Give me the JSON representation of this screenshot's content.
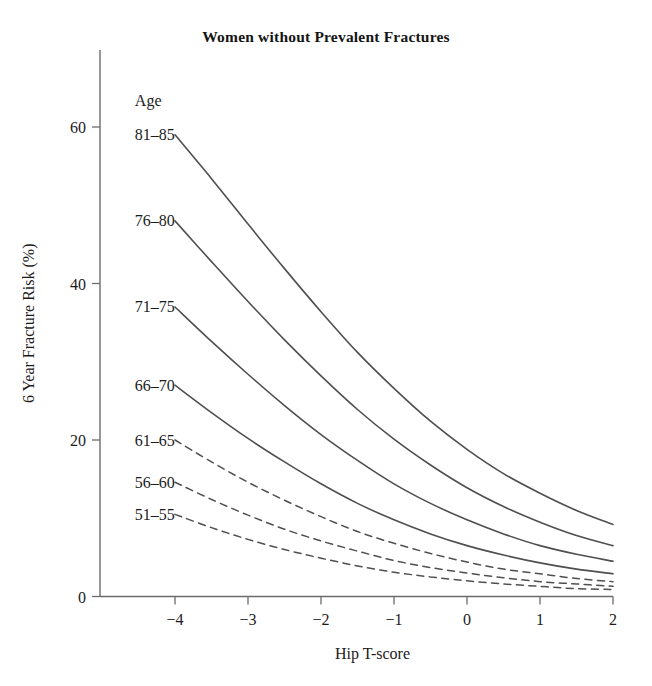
{
  "chart_data": {
    "type": "line",
    "title": "Women without Prevalent Fractures",
    "xlabel": "Hip T-score",
    "ylabel": "6 Year Fracture Risk (%)",
    "xlim": [
      -4.7,
      2.0
    ],
    "ylim": [
      0,
      64
    ],
    "xticks": [
      -4,
      -3,
      -2,
      -1,
      0,
      1,
      2
    ],
    "xticklabels": [
      "−4",
      "−3",
      "−2",
      "−1",
      "0",
      "1",
      "2"
    ],
    "yticks": [
      0,
      20,
      40,
      60
    ],
    "yticklabels": [
      "0",
      "20",
      "40",
      "60"
    ],
    "grid": false,
    "legend_position": "inline-left-of-curves",
    "legend_title": "Age",
    "x": [
      -4,
      -3.5,
      -3,
      -2.5,
      -2,
      -1.5,
      -1,
      -0.5,
      0,
      0.5,
      1,
      1.5,
      2
    ],
    "series": [
      {
        "name": "81–85",
        "style": "solid",
        "color": "#4f4f4f",
        "values": [
          59.0,
          53.4,
          47.6,
          41.9,
          36.4,
          31.2,
          26.6,
          22.4,
          18.8,
          15.7,
          13.2,
          11.0,
          9.2
        ]
      },
      {
        "name": "76–80",
        "style": "solid",
        "color": "#4f4f4f",
        "values": [
          48.0,
          42.8,
          37.7,
          32.8,
          28.2,
          23.9,
          20.1,
          16.8,
          13.9,
          11.5,
          9.5,
          7.8,
          6.5
        ]
      },
      {
        "name": "71–75",
        "style": "solid",
        "color": "#4f4f4f",
        "values": [
          37.0,
          32.6,
          28.4,
          24.4,
          20.7,
          17.4,
          14.4,
          11.9,
          9.8,
          8.0,
          6.5,
          5.4,
          4.5
        ]
      },
      {
        "name": "66–70",
        "style": "solid",
        "color": "#4f4f4f",
        "values": [
          27.0,
          23.5,
          20.2,
          17.2,
          14.4,
          11.9,
          9.8,
          8.0,
          6.5,
          5.3,
          4.3,
          3.5,
          2.9
        ]
      },
      {
        "name": "61–65",
        "style": "dashed",
        "color": "#5a5a5a",
        "values": [
          20.0,
          17.2,
          14.6,
          12.3,
          10.2,
          8.3,
          6.8,
          5.5,
          4.4,
          3.5,
          2.9,
          2.3,
          1.9
        ]
      },
      {
        "name": "56–60",
        "style": "dashed",
        "color": "#5a5a5a",
        "values": [
          14.6,
          12.4,
          10.4,
          8.6,
          7.1,
          5.8,
          4.6,
          3.7,
          3.0,
          2.4,
          1.9,
          1.6,
          1.3
        ]
      },
      {
        "name": "51–55",
        "style": "dashed",
        "color": "#5a5a5a",
        "values": [
          10.5,
          8.8,
          7.3,
          6.0,
          4.9,
          3.9,
          3.1,
          2.5,
          2.0,
          1.6,
          1.3,
          1.0,
          0.9
        ]
      }
    ],
    "series_label_positions": [
      {
        "name": "81–85",
        "x": -4.55,
        "y": 59.0
      },
      {
        "name": "76–80",
        "x": -4.55,
        "y": 48.0
      },
      {
        "name": "71–75",
        "x": -4.55,
        "y": 37.0
      },
      {
        "name": "66–70",
        "x": -4.55,
        "y": 27.0
      },
      {
        "name": "61–65",
        "x": -4.55,
        "y": 20.0
      },
      {
        "name": "56–60",
        "x": -4.55,
        "y": 14.6
      },
      {
        "name": "51–55",
        "x": -4.55,
        "y": 10.5
      }
    ]
  },
  "colors": {
    "background": "#ffffff",
    "axis": "#6b6b6b",
    "text": "#1c1c1c",
    "curve_solid": "#4f4f4f",
    "curve_dashed": "#5a5a5a"
  }
}
